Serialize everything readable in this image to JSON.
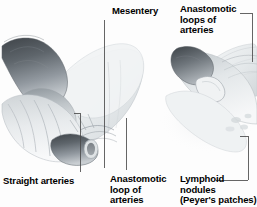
{
  "figure": {
    "background_color": "#fdfdfd",
    "text_color": "#000000",
    "leader_line_color": "#4a4a4a",
    "style": "grayscale medical illustration"
  },
  "labels": {
    "mesentery": "Mesentery",
    "anastomotic_loops_of_arteries": "Anastomotic\nloops of\narteries",
    "straight_arteries": "Straight arteries",
    "anastomotic_loop_of_arteries": "Anastomotic\nloop of\narteries",
    "lymphoid_nodules": "Lymphoid\nnodules\n(Peyer's patches)"
  },
  "illustrations": {
    "left": {
      "name": "coiled-small-intestine-with-mesentery",
      "description": "Looped segment of small intestine with attached mesentery fold showing straight arteries and an anastomotic arterial loop"
    },
    "right": {
      "name": "opened-intestinal-segment",
      "description": "Curved intestinal segment cut open at proximal end showing lymphoid nodules (Peyer's patches) on mucosa and anastomotic arterial loops in the mesentery"
    }
  },
  "palette": {
    "dark_tissue": "#4d5156",
    "mid_tissue": "#9aa0a4",
    "light_tissue": "#d8dcde",
    "pale_tissue": "#eef1f2",
    "outline": "#7b8186",
    "shadow": "#c6cbce"
  }
}
